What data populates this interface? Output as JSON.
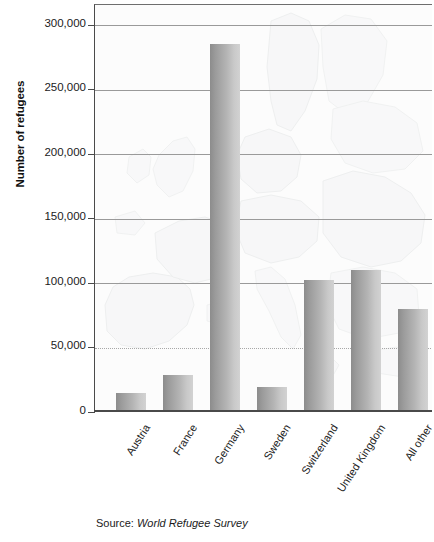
{
  "chart_data": {
    "type": "bar",
    "title": "",
    "subtitle": "",
    "xlabel": "",
    "ylabel": "Number of refugees",
    "categories": [
      "Austria",
      "France",
      "Germany",
      "Sweden",
      "Switzerland",
      "United Kingdom",
      "All other"
    ],
    "values": [
      15000,
      29000,
      285000,
      19000,
      102000,
      110000,
      80000
    ],
    "ylim": [
      0,
      316000
    ],
    "yticks": [
      0,
      50000,
      100000,
      150000,
      200000,
      250000,
      300000
    ],
    "ytick_labels": [
      "0",
      "50,000",
      "100,000",
      "150,000",
      "200,000",
      "250,000",
      "300,000"
    ],
    "grid": "horizontal",
    "legend": "none",
    "annotations": {
      "source_label": "Source:",
      "source_title": "World Refugee Survey"
    },
    "style": {
      "bar_fill_dark": "#8c8c8c",
      "bar_fill_light": "#d2d2d2",
      "gridline_color": "#9a9a9a",
      "axis_color": "#4a4a4a",
      "background": "#fdfdfd",
      "watermark": "europe-map"
    }
  },
  "axis": {
    "y_title": "Number of refugees"
  },
  "source": {
    "label": "Source:",
    "title": "World Refugee Survey"
  }
}
